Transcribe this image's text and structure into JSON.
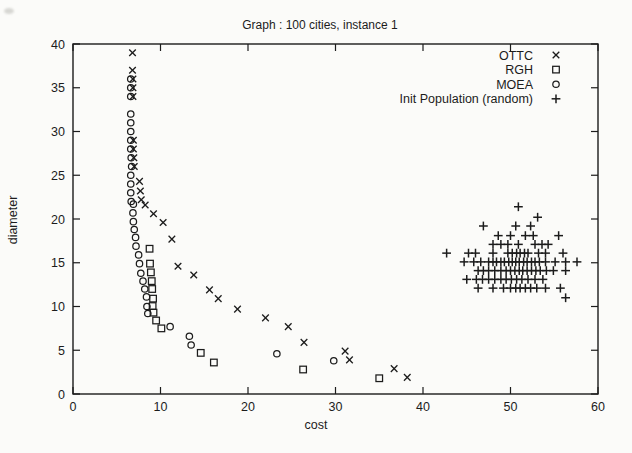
{
  "title": "Graph : 100 cities, instance 1",
  "axes": {
    "x": {
      "label": "cost",
      "min": 0,
      "max": 60,
      "ticks": [
        0,
        10,
        20,
        30,
        40,
        50,
        60
      ]
    },
    "y": {
      "label": "diameter",
      "min": 0,
      "max": 40,
      "ticks": [
        0,
        5,
        10,
        15,
        20,
        25,
        30,
        35,
        40
      ]
    }
  },
  "legend": {
    "position": "top-right-inside",
    "entries": [
      {
        "label": "OTTC",
        "marker": "x"
      },
      {
        "label": "RGH",
        "marker": "square"
      },
      {
        "label": "MOEA",
        "marker": "circle"
      },
      {
        "label": "Init Population (random)",
        "marker": "plus"
      }
    ]
  },
  "colors": {
    "ink": "#1c1c1c",
    "background": "#fbfbf9"
  },
  "chart_data": {
    "type": "scatter",
    "title": "Graph : 100 cities, instance 1",
    "xlabel": "cost",
    "ylabel": "diameter",
    "xlim": [
      0,
      60
    ],
    "ylim": [
      0,
      40
    ],
    "grid": false,
    "legend_position": "top-right-inside",
    "series": [
      {
        "name": "OTTC",
        "marker": "x",
        "points": [
          [
            6.8,
            39
          ],
          [
            6.8,
            37
          ],
          [
            6.85,
            36
          ],
          [
            6.85,
            35
          ],
          [
            6.85,
            34
          ],
          [
            6.9,
            29
          ],
          [
            6.9,
            28
          ],
          [
            6.95,
            27
          ],
          [
            7.0,
            26
          ],
          [
            7.6,
            24.3
          ],
          [
            7.7,
            23.2
          ],
          [
            7.8,
            22.2
          ],
          [
            8.25,
            21.6
          ],
          [
            9.2,
            20.6
          ],
          [
            10.3,
            19.6
          ],
          [
            11.3,
            17.7
          ],
          [
            12.0,
            14.6
          ],
          [
            13.8,
            13.6
          ],
          [
            15.6,
            11.9
          ],
          [
            16.6,
            10.9
          ],
          [
            18.8,
            9.7
          ],
          [
            22.0,
            8.7
          ],
          [
            24.6,
            7.7
          ],
          [
            26.4,
            5.9
          ],
          [
            31.1,
            4.9
          ],
          [
            31.6,
            3.9
          ],
          [
            36.7,
            2.9
          ],
          [
            38.2,
            1.9
          ]
        ]
      },
      {
        "name": "RGH",
        "marker": "square",
        "points": [
          [
            8.75,
            16.6
          ],
          [
            8.8,
            14.9
          ],
          [
            8.9,
            13.9
          ],
          [
            9.0,
            12.9
          ],
          [
            9.05,
            12.0
          ],
          [
            9.15,
            10.9
          ],
          [
            9.1,
            10.05
          ],
          [
            9.2,
            9.3
          ],
          [
            9.5,
            8.4
          ],
          [
            10.1,
            7.5
          ],
          [
            14.6,
            4.7
          ],
          [
            16.1,
            3.6
          ],
          [
            26.3,
            2.8
          ],
          [
            35.0,
            1.8
          ]
        ]
      },
      {
        "name": "MOEA",
        "marker": "circle",
        "points": [
          [
            6.6,
            36
          ],
          [
            6.6,
            35
          ],
          [
            6.6,
            34
          ],
          [
            6.6,
            32
          ],
          [
            6.6,
            31
          ],
          [
            6.6,
            30
          ],
          [
            6.6,
            29
          ],
          [
            6.6,
            28
          ],
          [
            6.65,
            27
          ],
          [
            6.7,
            26
          ],
          [
            6.6,
            25
          ],
          [
            6.6,
            24
          ],
          [
            6.6,
            23
          ],
          [
            6.65,
            22
          ],
          [
            6.9,
            21.7
          ],
          [
            6.85,
            20.7
          ],
          [
            6.9,
            19.7
          ],
          [
            7.0,
            18.8
          ],
          [
            7.15,
            17.9
          ],
          [
            7.2,
            16.9
          ],
          [
            7.5,
            15.9
          ],
          [
            7.6,
            14.9
          ],
          [
            7.75,
            13.8
          ],
          [
            8.0,
            12.9
          ],
          [
            8.2,
            12.0
          ],
          [
            8.4,
            11.1
          ],
          [
            8.45,
            10.0
          ],
          [
            8.55,
            9.2
          ],
          [
            11.1,
            7.7
          ],
          [
            13.3,
            6.6
          ],
          [
            13.5,
            5.6
          ],
          [
            23.3,
            4.6
          ],
          [
            29.8,
            3.8
          ]
        ]
      },
      {
        "name": "Init Population (random)",
        "marker": "plus",
        "points": [
          [
            50.9,
            21.4
          ],
          [
            53.1,
            20.2
          ],
          [
            46.9,
            19.2
          ],
          [
            50.6,
            19.2
          ],
          [
            52.3,
            19.2
          ],
          [
            48.6,
            18.1
          ],
          [
            50.0,
            18.1
          ],
          [
            51.7,
            18.1
          ],
          [
            52.6,
            18.1
          ],
          [
            55.5,
            18.1
          ],
          [
            48.0,
            17.1
          ],
          [
            48.9,
            17.1
          ],
          [
            49.7,
            17.1
          ],
          [
            50.9,
            17.1
          ],
          [
            52.8,
            17.1
          ],
          [
            53.6,
            17.1
          ],
          [
            54.3,
            17.1
          ],
          [
            42.7,
            16.1
          ],
          [
            45.2,
            16.1
          ],
          [
            46.0,
            16.1
          ],
          [
            48.0,
            16.1
          ],
          [
            49.7,
            16.1
          ],
          [
            50.2,
            16.1
          ],
          [
            50.7,
            16.1
          ],
          [
            51.1,
            16.1
          ],
          [
            51.6,
            16.1
          ],
          [
            52.0,
            16.1
          ],
          [
            53.2,
            16.1
          ],
          [
            54.0,
            16.1
          ],
          [
            56.0,
            16.1
          ],
          [
            44.7,
            15.1
          ],
          [
            45.8,
            15.1
          ],
          [
            46.6,
            15.1
          ],
          [
            47.5,
            15.1
          ],
          [
            48.0,
            15.1
          ],
          [
            48.4,
            15.1
          ],
          [
            48.9,
            15.1
          ],
          [
            49.3,
            15.1
          ],
          [
            49.8,
            15.1
          ],
          [
            50.2,
            15.1
          ],
          [
            50.6,
            15.1
          ],
          [
            51.0,
            15.1
          ],
          [
            51.5,
            15.1
          ],
          [
            51.9,
            15.1
          ],
          [
            52.4,
            15.1
          ],
          [
            52.8,
            15.1
          ],
          [
            53.3,
            15.1
          ],
          [
            54.0,
            15.1
          ],
          [
            55.1,
            15.1
          ],
          [
            56.3,
            15.1
          ],
          [
            57.6,
            15.1
          ],
          [
            46.3,
            14.1
          ],
          [
            46.9,
            14.1
          ],
          [
            47.5,
            14.1
          ],
          [
            48.2,
            14.1
          ],
          [
            48.9,
            14.1
          ],
          [
            49.5,
            14.1
          ],
          [
            50.0,
            14.1
          ],
          [
            50.5,
            14.1
          ],
          [
            51.0,
            14.1
          ],
          [
            51.4,
            14.1
          ],
          [
            51.9,
            14.1
          ],
          [
            52.4,
            14.1
          ],
          [
            52.9,
            14.1
          ],
          [
            53.4,
            14.1
          ],
          [
            54.1,
            14.1
          ],
          [
            54.9,
            14.1
          ],
          [
            56.3,
            14.1
          ],
          [
            45.0,
            13.1
          ],
          [
            46.1,
            13.1
          ],
          [
            46.8,
            13.1
          ],
          [
            47.5,
            13.1
          ],
          [
            48.2,
            13.1
          ],
          [
            48.9,
            13.1
          ],
          [
            49.5,
            13.1
          ],
          [
            50.1,
            13.1
          ],
          [
            50.7,
            13.1
          ],
          [
            51.3,
            13.1
          ],
          [
            52.0,
            13.1
          ],
          [
            52.8,
            13.1
          ],
          [
            53.7,
            13.1
          ],
          [
            46.3,
            12.1
          ],
          [
            48.0,
            12.1
          ],
          [
            49.2,
            12.1
          ],
          [
            50.0,
            12.1
          ],
          [
            50.6,
            12.1
          ],
          [
            51.1,
            12.1
          ],
          [
            51.7,
            12.1
          ],
          [
            52.3,
            12.1
          ],
          [
            53.0,
            12.1
          ],
          [
            54.0,
            12.1
          ],
          [
            55.7,
            12.1
          ],
          [
            56.3,
            11.0
          ]
        ]
      }
    ]
  }
}
